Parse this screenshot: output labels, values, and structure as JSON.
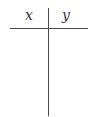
{
  "t_chart": {
    "columns": [
      {
        "header": "x",
        "values": []
      },
      {
        "header": "y",
        "values": []
      }
    ],
    "line_color": "#4a4a4a",
    "text_color": "#333333"
  }
}
